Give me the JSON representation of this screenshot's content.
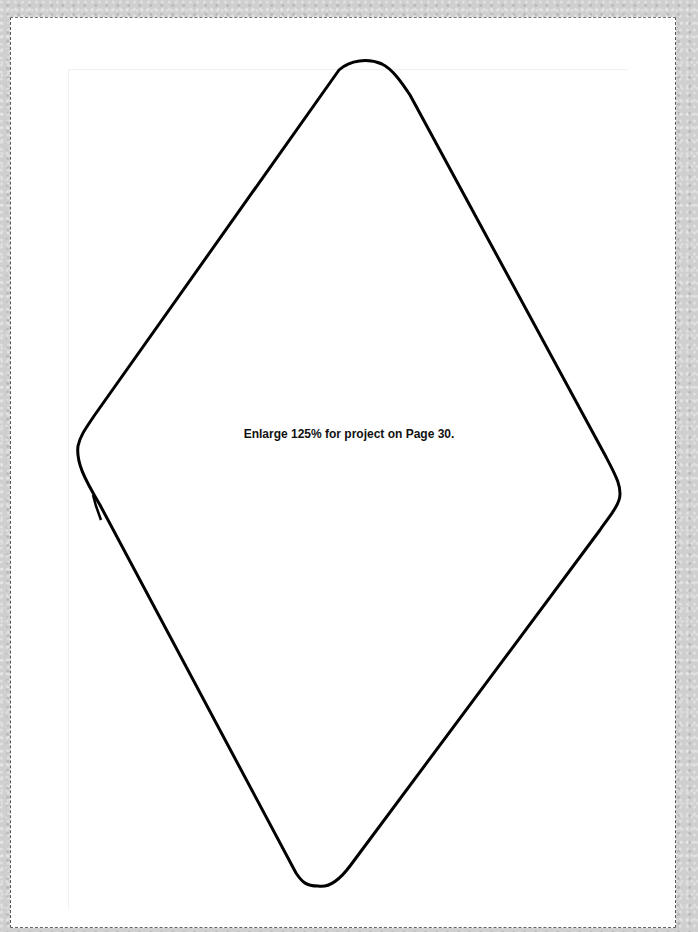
{
  "document": {
    "caption": "Enlarge 125% for project on Page 30.",
    "template_shape": "rounded-diamond-outline",
    "colors": {
      "paper": "#ffffff",
      "outline": "#000000",
      "background": "#cfcfcf",
      "cut_line": "#555555"
    }
  }
}
